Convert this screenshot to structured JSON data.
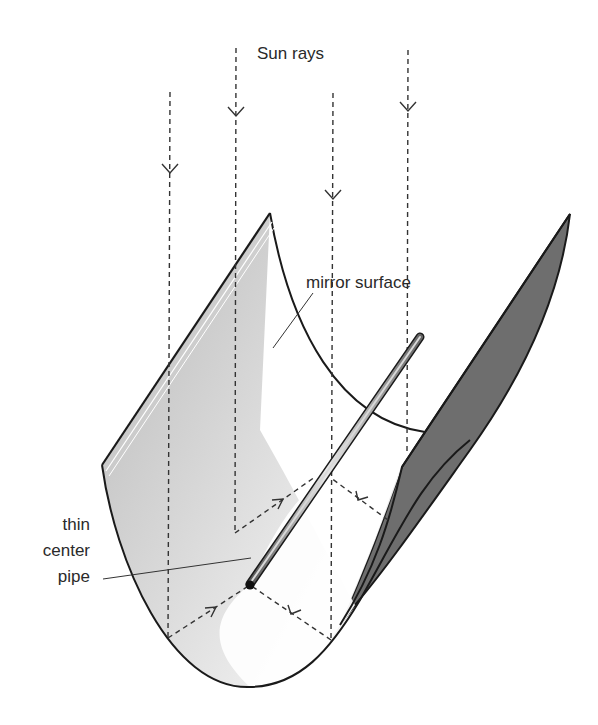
{
  "diagram": {
    "labels": {
      "sun_rays": "Sun rays",
      "mirror_surface": "mirror surface",
      "pipe_line1": "thin",
      "pipe_line2": "center",
      "pipe_line3": "pipe"
    },
    "colors": {
      "outline": "#1a1a1a",
      "back_face": "#6e6e6e",
      "mirror_gradient_dark": "#bdbdbd",
      "mirror_gradient_light": "#f4f4f4",
      "pipe": "#9a9a9a",
      "ray": "#333333"
    },
    "rays": [
      {
        "x": 170,
        "y_start": 92,
        "y_end": 638,
        "arrow_y": 172
      },
      {
        "x": 236,
        "y_start": 48,
        "y_end": 533,
        "arrow_y": 115
      },
      {
        "x": 333,
        "y_start": 93,
        "y_end": 640,
        "arrow_y": 198
      },
      {
        "x": 408,
        "y_start": 50,
        "y_end": 452,
        "arrow_y": 110
      }
    ]
  }
}
